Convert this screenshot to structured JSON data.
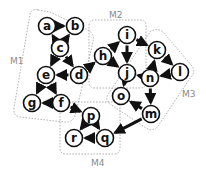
{
  "diagram": {
    "type": "directed-graph-modules",
    "modules": [
      {
        "id": "M1",
        "label": "M1",
        "nodes": [
          "a",
          "b",
          "c",
          "d",
          "e",
          "f",
          "g"
        ]
      },
      {
        "id": "M2",
        "label": "M2",
        "nodes": [
          "h",
          "i",
          "j"
        ]
      },
      {
        "id": "M3",
        "label": "M3",
        "nodes": [
          "k",
          "l",
          "n",
          "o",
          "m"
        ]
      },
      {
        "id": "M4",
        "label": "M4",
        "nodes": [
          "p",
          "q",
          "r"
        ]
      }
    ],
    "nodes": [
      {
        "id": "a",
        "label": "a",
        "x": 47,
        "y": 26
      },
      {
        "id": "b",
        "label": "b",
        "x": 75,
        "y": 26
      },
      {
        "id": "c",
        "label": "c",
        "x": 60,
        "y": 48
      },
      {
        "id": "d",
        "label": "d",
        "x": 79,
        "y": 75
      },
      {
        "id": "e",
        "label": "e",
        "x": 46,
        "y": 75
      },
      {
        "id": "f",
        "label": "f",
        "x": 61,
        "y": 103
      },
      {
        "id": "g",
        "label": "g",
        "x": 32,
        "y": 103
      },
      {
        "id": "h",
        "label": "h",
        "x": 103,
        "y": 56
      },
      {
        "id": "i",
        "label": "i",
        "x": 127,
        "y": 35
      },
      {
        "id": "j",
        "label": "j",
        "x": 127,
        "y": 73
      },
      {
        "id": "k",
        "label": "k",
        "x": 157,
        "y": 50
      },
      {
        "id": "l",
        "label": "l",
        "x": 180,
        "y": 72
      },
      {
        "id": "n",
        "label": "n",
        "x": 150,
        "y": 78
      },
      {
        "id": "o",
        "label": "o",
        "x": 121,
        "y": 96
      },
      {
        "id": "m",
        "label": "m",
        "x": 151,
        "y": 114
      },
      {
        "id": "p",
        "label": "p",
        "x": 91,
        "y": 116
      },
      {
        "id": "r",
        "label": "r",
        "x": 74,
        "y": 138
      },
      {
        "id": "q",
        "label": "q",
        "x": 105,
        "y": 138
      }
    ],
    "edges": [
      {
        "from": "a",
        "to": "b"
      },
      {
        "from": "c",
        "to": "a"
      },
      {
        "from": "c",
        "to": "b"
      },
      {
        "from": "c",
        "to": "e"
      },
      {
        "from": "c",
        "to": "d"
      },
      {
        "from": "d",
        "to": "e"
      },
      {
        "from": "e",
        "to": "g"
      },
      {
        "from": "e",
        "to": "f"
      },
      {
        "from": "f",
        "to": "g"
      },
      {
        "from": "d",
        "to": "h"
      },
      {
        "from": "h",
        "to": "i"
      },
      {
        "from": "i",
        "to": "j"
      },
      {
        "from": "h",
        "to": "j"
      },
      {
        "from": "i",
        "to": "k"
      },
      {
        "from": "n",
        "to": "j"
      },
      {
        "from": "n",
        "to": "k"
      },
      {
        "from": "k",
        "to": "l"
      },
      {
        "from": "l",
        "to": "n"
      },
      {
        "from": "n",
        "to": "m"
      },
      {
        "from": "j",
        "to": "o"
      },
      {
        "from": "m",
        "to": "o"
      },
      {
        "from": "m",
        "to": "q"
      },
      {
        "from": "f",
        "to": "p"
      },
      {
        "from": "p",
        "to": "r"
      },
      {
        "from": "p",
        "to": "q"
      },
      {
        "from": "q",
        "to": "r"
      }
    ]
  }
}
